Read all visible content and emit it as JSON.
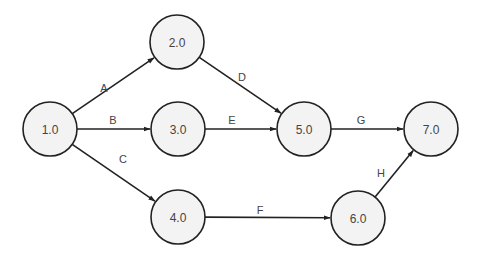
{
  "diagram": {
    "type": "activity-on-arrow network",
    "nodes": [
      {
        "id": "n1",
        "label": "1.0",
        "x": 50,
        "y": 129
      },
      {
        "id": "n2",
        "label": "2.0",
        "x": 177,
        "y": 42
      },
      {
        "id": "n3",
        "label": "3.0",
        "x": 178,
        "y": 129
      },
      {
        "id": "n4",
        "label": "4.0",
        "x": 178,
        "y": 217
      },
      {
        "id": "n5",
        "label": "5.0",
        "x": 304,
        "y": 129
      },
      {
        "id": "n6",
        "label": "6.0",
        "x": 358,
        "y": 218
      },
      {
        "id": "n7",
        "label": "7.0",
        "x": 431,
        "y": 129
      }
    ],
    "node_radius": 27,
    "edges": [
      {
        "id": "A",
        "label": "A",
        "from": "1.0",
        "to": "2.0",
        "label_x": 104,
        "label_y": 88
      },
      {
        "id": "B",
        "label": "B",
        "from": "1.0",
        "to": "3.0",
        "label_x": 113,
        "label_y": 120
      },
      {
        "id": "C",
        "label": "C",
        "from": "1.0",
        "to": "4.0",
        "label_x": 123,
        "label_y": 159
      },
      {
        "id": "D",
        "label": "D",
        "from": "2.0",
        "to": "5.0",
        "label_x": 242,
        "label_y": 77
      },
      {
        "id": "E",
        "label": "E",
        "from": "3.0",
        "to": "5.0",
        "label_x": 232,
        "label_y": 120
      },
      {
        "id": "F",
        "label": "F",
        "from": "4.0",
        "to": "6.0",
        "label_x": 260,
        "label_y": 210
      },
      {
        "id": "G",
        "label": "G",
        "from": "5.0",
        "to": "7.0",
        "label_x": 361,
        "label_y": 120
      },
      {
        "id": "H",
        "label": "H",
        "from": "6.0",
        "to": "7.0",
        "label_x": 381,
        "label_y": 173
      }
    ],
    "colors": {
      "node_fill": "#f3f3f3",
      "stroke": "#222222",
      "text": "#444444"
    }
  }
}
